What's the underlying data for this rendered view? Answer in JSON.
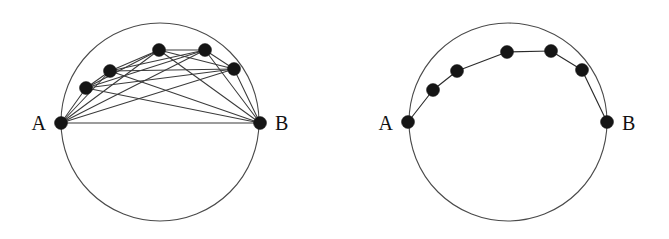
{
  "figure": {
    "background_color": "#ffffff",
    "width": 669,
    "height": 239,
    "node_color": "#151515",
    "edge_color": "#3b3b3b",
    "circle_color": "#4a4a4a",
    "node_radius": 6.5
  },
  "panels": [
    {
      "id": "left-panel",
      "name": "complete-graph-panel",
      "circle": {
        "cx": 160,
        "cy": 122,
        "r": 99
      },
      "labels": {
        "start": "A",
        "end": "B",
        "start_pos": {
          "x": 46,
          "y": 130
        },
        "end_pos": {
          "x": 275,
          "y": 130
        }
      },
      "nodes": [
        {
          "id": "A",
          "label": "A",
          "x": 61,
          "y": 123
        },
        {
          "id": "v1",
          "label": "",
          "x": 86,
          "y": 88
        },
        {
          "id": "v2",
          "label": "",
          "x": 110,
          "y": 71
        },
        {
          "id": "v3",
          "label": "",
          "x": 159,
          "y": 50
        },
        {
          "id": "v4",
          "label": "",
          "x": 205,
          "y": 50
        },
        {
          "id": "v5",
          "label": "",
          "x": 234,
          "y": 69
        },
        {
          "id": "B",
          "label": "B",
          "x": 260,
          "y": 123
        }
      ],
      "edges": [
        [
          "A",
          "v1"
        ],
        [
          "A",
          "v2"
        ],
        [
          "A",
          "v3"
        ],
        [
          "A",
          "v4"
        ],
        [
          "A",
          "v5"
        ],
        [
          "A",
          "B"
        ],
        [
          "v1",
          "v2"
        ],
        [
          "v1",
          "v3"
        ],
        [
          "v1",
          "v4"
        ],
        [
          "v1",
          "v5"
        ],
        [
          "v1",
          "B"
        ],
        [
          "v2",
          "v3"
        ],
        [
          "v2",
          "v4"
        ],
        [
          "v2",
          "v5"
        ],
        [
          "v2",
          "B"
        ],
        [
          "v3",
          "v4"
        ],
        [
          "v3",
          "v5"
        ],
        [
          "v3",
          "B"
        ],
        [
          "v4",
          "v5"
        ],
        [
          "v4",
          "B"
        ],
        [
          "v5",
          "B"
        ]
      ]
    },
    {
      "id": "right-panel",
      "name": "path-graph-panel",
      "circle": {
        "cx": 508,
        "cy": 122,
        "r": 99
      },
      "labels": {
        "start": "A",
        "end": "B",
        "start_pos": {
          "x": 393,
          "y": 130
        },
        "end_pos": {
          "x": 622,
          "y": 130
        }
      },
      "nodes": [
        {
          "id": "A",
          "label": "A",
          "x": 408,
          "y": 122
        },
        {
          "id": "w1",
          "label": "",
          "x": 433,
          "y": 90
        },
        {
          "id": "w2",
          "label": "",
          "x": 457,
          "y": 71
        },
        {
          "id": "w3",
          "label": "",
          "x": 507,
          "y": 52
        },
        {
          "id": "w4",
          "label": "",
          "x": 551,
          "y": 51
        },
        {
          "id": "w5",
          "label": "",
          "x": 582,
          "y": 70
        },
        {
          "id": "B",
          "label": "B",
          "x": 607,
          "y": 122
        }
      ],
      "edges": [
        [
          "A",
          "w1"
        ],
        [
          "w1",
          "w2"
        ],
        [
          "w2",
          "w3"
        ],
        [
          "w3",
          "w4"
        ],
        [
          "w4",
          "w5"
        ],
        [
          "w5",
          "B"
        ]
      ]
    }
  ]
}
